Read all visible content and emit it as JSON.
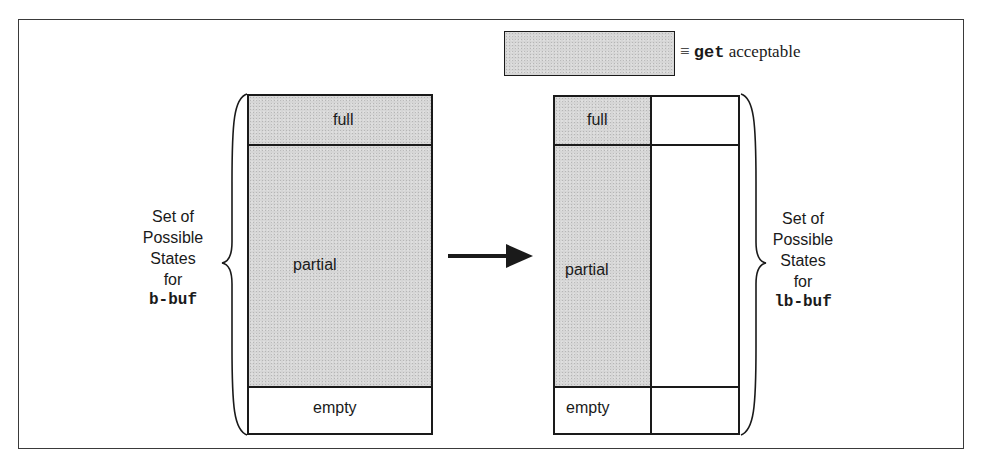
{
  "legend": {
    "symbol": "≡",
    "keyword": "get",
    "text": "acceptable",
    "fill_color": "#d6d6d6"
  },
  "left_diagram": {
    "states": [
      {
        "label": "full",
        "acceptable": true
      },
      {
        "label": "partial",
        "acceptable": true
      },
      {
        "label": "empty",
        "acceptable": false
      }
    ],
    "brace_label": {
      "lines": [
        "Set of",
        "Possible",
        "States",
        "for"
      ],
      "name": "b-buf"
    }
  },
  "right_diagram": {
    "states": [
      {
        "label": "full",
        "left_acceptable": true,
        "right_acceptable": false
      },
      {
        "label": "partial",
        "left_acceptable": true,
        "right_acceptable": false
      },
      {
        "label": "empty",
        "left_acceptable": false,
        "right_acceptable": false
      }
    ],
    "brace_label": {
      "lines": [
        "Set of",
        "Possible",
        "States",
        "for"
      ],
      "name": "lb-buf"
    }
  },
  "arrow": {
    "direction": "right"
  },
  "colors": {
    "line": "#1a1a1a",
    "shade": "#d6d6d6",
    "background": "#ffffff"
  }
}
